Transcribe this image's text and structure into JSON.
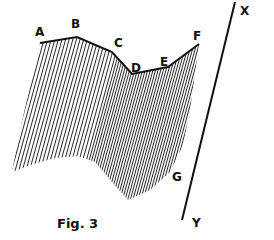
{
  "figure": {
    "caption": "Fig. 3",
    "ink_color": "#111111",
    "background": "#ffffff",
    "profile_points": [
      {
        "label": "A",
        "x": 40,
        "y": 43,
        "label_x": 35,
        "label_y": 36
      },
      {
        "label": "B",
        "x": 77,
        "y": 37,
        "label_x": 71,
        "label_y": 28
      },
      {
        "label": "C",
        "x": 112,
        "y": 52,
        "label_x": 114,
        "label_y": 47
      },
      {
        "label": "D",
        "x": 132,
        "y": 74,
        "label_x": 131,
        "label_y": 72
      },
      {
        "label": "E",
        "x": 168,
        "y": 67,
        "label_x": 160,
        "label_y": 66
      },
      {
        "label": "F",
        "x": 199,
        "y": 44,
        "label_x": 193,
        "label_y": 40
      }
    ],
    "bottom_label": {
      "label": "G",
      "x": 172,
      "y": 181
    },
    "axis_line": {
      "start": {
        "label": "X",
        "x": 235,
        "y": 2,
        "label_x": 240,
        "label_y": 15
      },
      "end": {
        "label": "Y",
        "x": 182,
        "y": 220,
        "label_x": 192,
        "label_y": 227
      }
    }
  }
}
